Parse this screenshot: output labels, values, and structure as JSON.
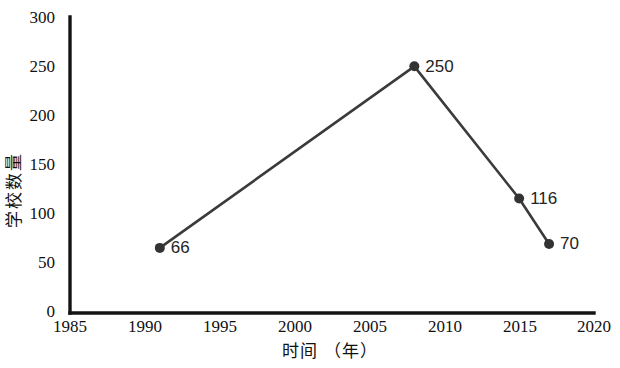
{
  "chart_data": {
    "type": "line",
    "title": "",
    "xlabel": "时间 （年）",
    "ylabel": "学校数量",
    "xlim": [
      1985,
      2020
    ],
    "ylim": [
      0,
      300
    ],
    "grid": false,
    "legend": "none",
    "x_ticks": [
      "1985",
      "1990",
      "1995",
      "2000",
      "2005",
      "2010",
      "2015",
      "2020"
    ],
    "x_tick_values": [
      1985,
      1990,
      1995,
      2000,
      2005,
      2010,
      2015,
      2020
    ],
    "y_ticks": [
      "0",
      "50",
      "100",
      "150",
      "200",
      "250",
      "300"
    ],
    "y_tick_values": [
      0,
      50,
      100,
      150,
      200,
      250,
      300
    ],
    "series": [
      {
        "name": "学校数量",
        "x": [
          1991,
          2008,
          2015,
          2017
        ],
        "values": [
          66,
          250,
          116,
          70
        ],
        "point_labels": [
          "66",
          "250",
          "116",
          "70"
        ],
        "line_color": "#3b3b3b",
        "marker_color": "#333333"
      }
    ],
    "points": [
      {
        "year": 1991,
        "value": 66,
        "label": "66"
      },
      {
        "year": 2008,
        "value": 250,
        "label": "250"
      },
      {
        "year": 2015,
        "value": 116,
        "label": "116"
      },
      {
        "year": 2017,
        "value": 70,
        "label": "70"
      }
    ],
    "colors": {
      "background": "#ffffff",
      "axis": "#141414",
      "line": "#3b3b3b",
      "marker": "#333333",
      "text": "#111111"
    }
  }
}
